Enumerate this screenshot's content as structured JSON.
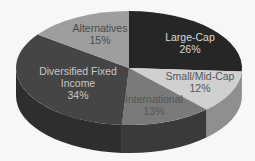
{
  "chart_data": {
    "type": "pie",
    "style": "3d",
    "title": "",
    "categories": [
      "Large-Cap",
      "Small/Mid-Cap",
      "International",
      "Diversified Fixed Income",
      "Alternatives"
    ],
    "values": [
      26,
      12,
      13,
      34,
      15
    ],
    "unit": "%",
    "legend": "none",
    "labels": [
      {
        "name": "Large-Cap",
        "value_label": "26%",
        "lines": [
          "Large-Cap",
          "26%"
        ]
      },
      {
        "name": "Small/Mid-Cap",
        "value_label": "12%",
        "lines": [
          "Small/Mid-Cap",
          "12%"
        ]
      },
      {
        "name": "International",
        "value_label": "13%",
        "lines": [
          "International",
          "13%"
        ]
      },
      {
        "name": "Diversified Fixed Income",
        "value_label": "34%",
        "lines": [
          "Diversified Fixed",
          "Income",
          "34%"
        ]
      },
      {
        "name": "Alternatives",
        "value_label": "15%",
        "lines": [
          "Alternatives",
          "15%"
        ]
      }
    ],
    "colors": {
      "Large-Cap": "#262626",
      "Small/Mid-Cap": "#d0d0d0",
      "International": "#7a7a7a",
      "Diversified Fixed Income": "#454545",
      "Alternatives": "#9e9e9e"
    },
    "side_colors": {
      "Small/Mid-Cap": "#8f8f8f",
      "International": "#3a3a3a",
      "Diversified Fixed Income": "#2e2e2e"
    },
    "text_colors": {
      "Large-Cap": "#d8d8d8",
      "Small/Mid-Cap": "#555555",
      "International": "#555555",
      "Diversified Fixed Income": "#c8c8c8",
      "Alternatives": "#4a4a4a"
    }
  }
}
